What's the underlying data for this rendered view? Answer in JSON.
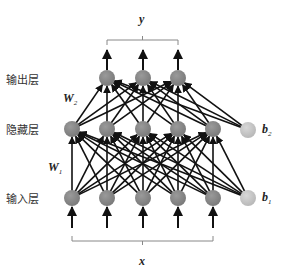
{
  "layers": {
    "output": {
      "label": "输出层",
      "y": 78,
      "nodes": [
        107,
        143,
        178
      ]
    },
    "hidden": {
      "label": "隐藏层",
      "y": 129,
      "nodes": [
        72,
        107,
        143,
        178,
        213
      ]
    },
    "input": {
      "label": "输入层",
      "y": 198,
      "nodes": [
        72,
        107,
        143,
        178,
        213
      ]
    }
  },
  "bias": {
    "b2": {
      "label": "b",
      "sub": "2",
      "x": 248,
      "y": 130
    },
    "b1": {
      "label": "b",
      "sub": "1",
      "x": 248,
      "y": 198
    }
  },
  "weights": {
    "w2": {
      "label": "W",
      "sub": "2"
    },
    "w1": {
      "label": "W",
      "sub": "1"
    }
  },
  "braces": {
    "output_label": "y",
    "input_label": "x"
  },
  "colors": {
    "neuron": "#7a7a7a",
    "bias": "#b8b8b8",
    "edge": "#111111",
    "brace": "#888888"
  }
}
